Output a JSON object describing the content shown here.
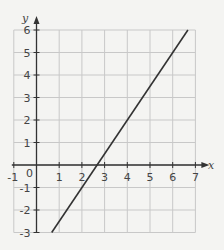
{
  "chart_data": {
    "type": "line",
    "title": "",
    "xlabel": "x",
    "ylabel": "y",
    "xlim": [
      -1,
      7
    ],
    "ylim": [
      -3,
      6
    ],
    "grid": true,
    "legend": null,
    "x_ticks": [
      -1,
      0,
      1,
      2,
      3,
      4,
      5,
      6,
      7
    ],
    "x_tick_labels": [
      "-1",
      "0",
      "1",
      "2",
      "3",
      "4",
      "5",
      "6",
      "7"
    ],
    "y_ticks": [
      -3,
      -2,
      -1,
      1,
      2,
      3,
      4,
      5,
      6
    ],
    "y_tick_labels": [
      "-3",
      "-2",
      "-1",
      "1",
      "2",
      "3",
      "4",
      "5",
      "6"
    ],
    "series": [
      {
        "name": "y = 1.5x - 4",
        "equation": "y = 1.5x - 4",
        "x": [
          0.67,
          6.67
        ],
        "y": [
          -3,
          6
        ],
        "color": "#333333"
      }
    ]
  },
  "colors": {
    "background": "#f4f4f2",
    "grid": "#c8c8c8",
    "axis": "#333333",
    "line": "#333333",
    "text": "#444444"
  }
}
